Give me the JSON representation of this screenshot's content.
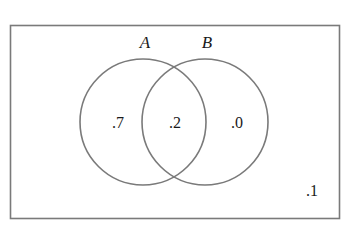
{
  "diagram": {
    "type": "venn",
    "universe": {
      "label": "",
      "outside_value": ".1"
    },
    "sets": [
      {
        "name": "A",
        "label": "A",
        "only_value": ".7"
      },
      {
        "name": "B",
        "label": "B",
        "only_value": ".0"
      }
    ],
    "intersection": {
      "sets": [
        "A",
        "B"
      ],
      "value": ".2"
    },
    "colors": {
      "stroke": "#7a7a7a",
      "text": "#1a1a1a",
      "background": "#ffffff"
    }
  }
}
